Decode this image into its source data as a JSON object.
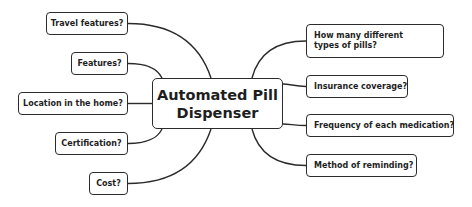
{
  "central_topic": {
    "line1": "Automated Pill",
    "line2": "Dispenser"
  },
  "left_branches": [
    {
      "label": "Travel features?"
    },
    {
      "label": "Features?"
    },
    {
      "label": "Location in the home?"
    },
    {
      "label": "Certification?"
    },
    {
      "label": "Cost?"
    }
  ],
  "right_branches": [
    {
      "label": "How many different types of pills?"
    },
    {
      "label": "Insurance coverage?"
    },
    {
      "label": "Frequency of each medication?"
    },
    {
      "label": "Method of reminding?"
    }
  ],
  "colors": {
    "stroke": "#2b2b2b",
    "text": "#1e1e1e",
    "background": "#ffffff"
  }
}
